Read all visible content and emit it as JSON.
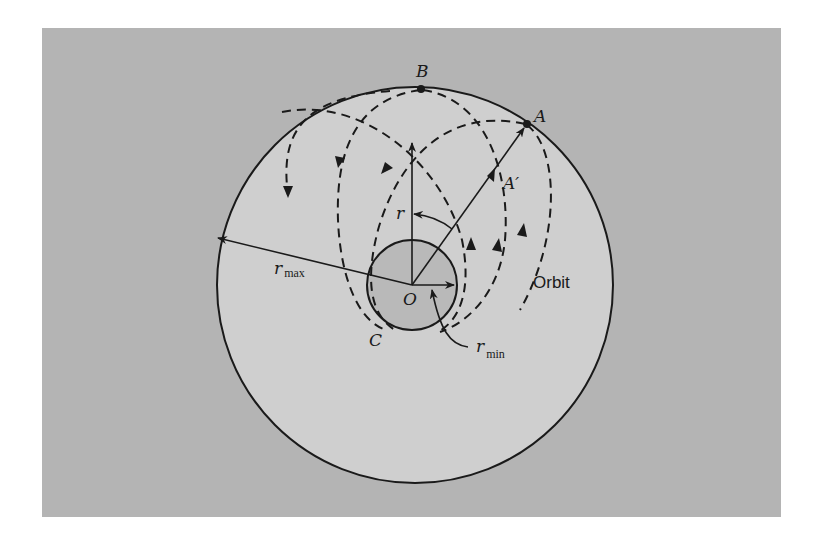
{
  "figure": {
    "colors": {
      "page_background": "#ffffff",
      "panel_background": "#b4b4b4",
      "outer_circle_fill": "#cfcfcf",
      "inner_circle_fill": "#b9b9b9",
      "ink": "#1a1a1a"
    },
    "labels": {
      "point_b": "B",
      "point_a": "A",
      "point_a_prime": "A′",
      "point_c": "C",
      "center_o": "O",
      "radius_r": "r",
      "r_max_main": "r",
      "r_max_sub": "max",
      "r_min_main": "r",
      "r_min_sub": "min",
      "orbit": "Orbit"
    },
    "elements": {
      "outer_boundary": "Circle of maximum radius r_max centered at O",
      "inner_boundary": "Circle of minimum radius r_min centered at O (shaded)",
      "orbit_curves": "Dashed rosette orbit loops touching outer circle at B and A and inner circle near C",
      "radius_vectors": [
        "O to top (r)",
        "O to A through A′",
        "O to left edge (r_max)",
        "O to right edge of inner circle"
      ],
      "angle_arc": "Arc with arrow between vector OA and vertical vector"
    }
  }
}
